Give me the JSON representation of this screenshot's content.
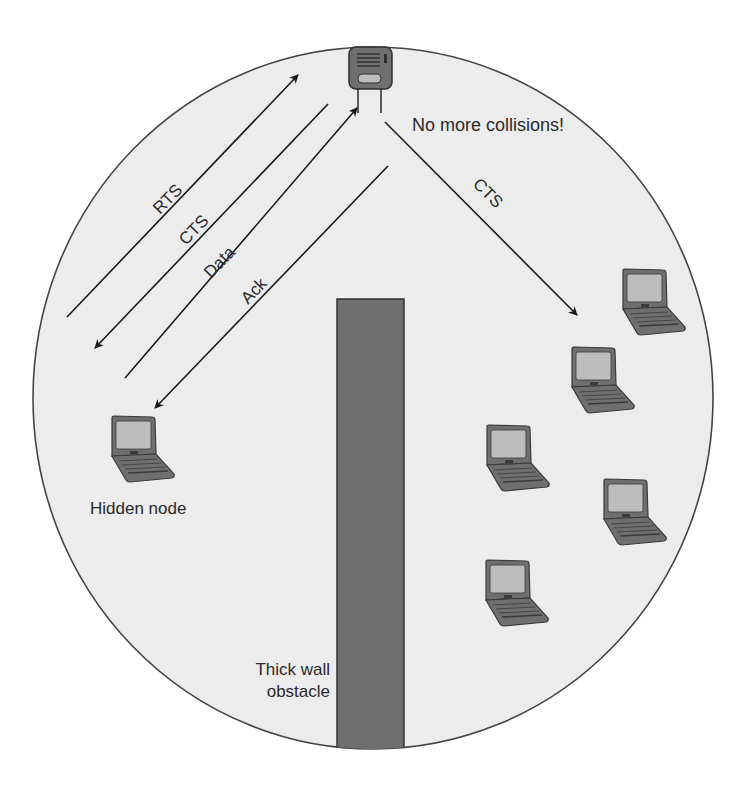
{
  "diagram": {
    "colors": {
      "background": "#ffffff",
      "coverage_fill": "#ececec",
      "coverage_stroke": "#444444",
      "wall_fill": "#6e6e6e",
      "wall_stroke": "#333333",
      "device_body": "#6f6f6f",
      "device_screen": "#bdbdbd",
      "arrow": "#1a1a1a",
      "text": "#2a2a2a"
    },
    "access_point": {
      "label": "",
      "note": "No more collisions!"
    },
    "hidden_node": {
      "label": "Hidden node"
    },
    "obstacle": {
      "label_line1": "Thick wall",
      "label_line2": "obstacle"
    },
    "exchange": [
      {
        "label": "RTS",
        "direction": "to-access-point"
      },
      {
        "label": "CTS",
        "direction": "to-hidden-node"
      },
      {
        "label": "Data",
        "direction": "to-access-point"
      },
      {
        "label": "Ack",
        "direction": "to-hidden-node"
      }
    ],
    "broadcast": {
      "label": "CTS",
      "direction": "to-other-clients"
    },
    "clients": [
      {
        "id": "client-1"
      },
      {
        "id": "client-2"
      },
      {
        "id": "client-3"
      },
      {
        "id": "client-4"
      },
      {
        "id": "client-5"
      }
    ]
  }
}
